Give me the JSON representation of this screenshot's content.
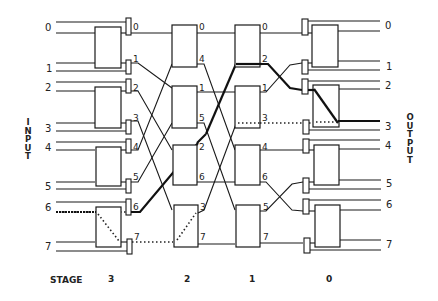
{
  "diagram": {
    "left_label": "INPUT",
    "right_label": "OUTPUT",
    "stage_caption": "STAGE",
    "stages": [
      "3",
      "2",
      "1",
      "0"
    ],
    "input_ports": [
      "0",
      "1",
      "2",
      "3",
      "4",
      "5",
      "6",
      "7"
    ],
    "output_ports": [
      "0",
      "1",
      "2",
      "3",
      "4",
      "5",
      "6",
      "7"
    ],
    "stage3_outputs": [
      "0",
      "1",
      "2",
      "3",
      "4",
      "5",
      "6",
      "7"
    ],
    "stage2_outputs": [
      "0",
      "4",
      "1",
      "5",
      "2",
      "6",
      "3",
      "7"
    ],
    "stage1_outputs": [
      "0",
      "2",
      "1",
      "3",
      "4",
      "6",
      "5",
      "7"
    ],
    "highlighted_path": {
      "from_input": "6",
      "to_output": "3",
      "style": "bold line, dotted inside switches"
    }
  }
}
